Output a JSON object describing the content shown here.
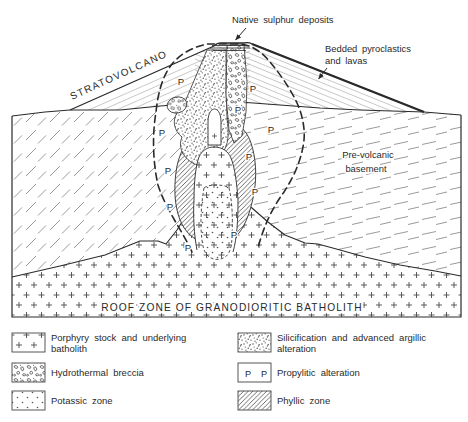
{
  "diagram": {
    "labels": {
      "native_sulphur": "Native sulphur deposits",
      "bedded_pyroclastics": [
        "Bedded pyroclastics",
        "and lavas"
      ],
      "stratovolcano": "STRATOVOLCANO",
      "prevolcanic_basement": [
        "Pre-volcanic",
        "basement"
      ],
      "roof_zone": "ROOF ZONE OF GRANODIORITIC BATHOLITH",
      "propylitic_marker": "P"
    }
  },
  "legend": {
    "items": [
      {
        "id": "porphyry",
        "pattern": "crosses",
        "lines": [
          "Porphyry stock and underlying",
          "batholith"
        ]
      },
      {
        "id": "breccia",
        "pattern": "breccia",
        "lines": [
          "Hydrothermal breccia"
        ]
      },
      {
        "id": "potassic",
        "pattern": "dots",
        "lines": [
          "Potassic zone"
        ]
      },
      {
        "id": "silicification",
        "pattern": "stipple",
        "lines": [
          "Silicification and advanced argillic",
          "alteration"
        ]
      },
      {
        "id": "propylitic",
        "pattern": "P-letters",
        "lines": [
          "Propylitic alteration"
        ]
      },
      {
        "id": "phyllic",
        "pattern": "hatch",
        "lines": [
          "Phyllic zone"
        ]
      }
    ]
  },
  "colors": {
    "ink": "#2a2a2a",
    "line_gray": "#8f8f8f",
    "background": "#ffffff"
  }
}
